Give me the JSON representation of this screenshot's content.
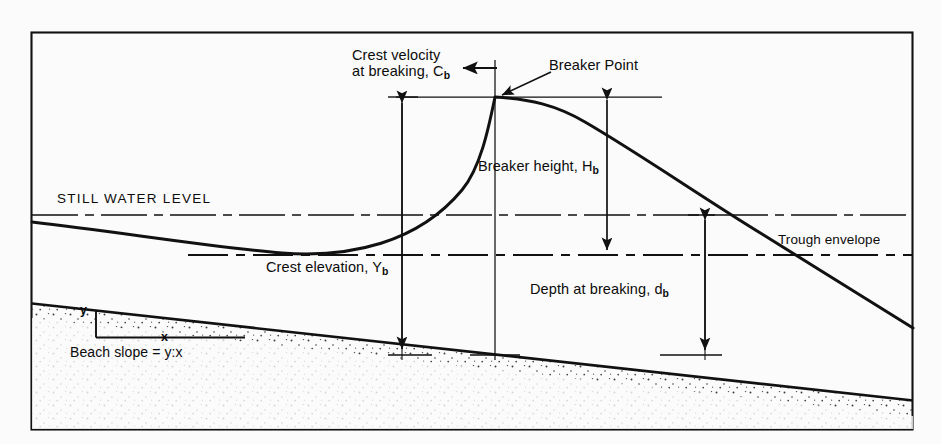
{
  "figure": {
    "type": "technical-diagram",
    "background_color": "#fbfbfb",
    "ink_color": "#111111",
    "frame": {
      "x": 31,
      "y": 32,
      "width": 882,
      "height": 398
    }
  },
  "labels": {
    "crest_velocity_line1": "Crest velocity",
    "crest_velocity_line2_text": "at breaking, C",
    "crest_velocity_sub": "b",
    "breaker_point": "Breaker Point",
    "breaker_height_text": "Breaker height, H",
    "breaker_height_sub": "b",
    "still_water_level": "STILL WATER LEVEL",
    "trough_envelope": "Trough envelope",
    "crest_elevation_text": "Crest elevation, Y",
    "crest_elevation_sub": "b",
    "depth_at_breaking_text": "Depth at breaking, d",
    "depth_at_breaking_sub": "b",
    "beach_slope": "Beach slope = y:x",
    "slope_rise": "y",
    "slope_run": "x"
  },
  "geometry": {
    "still_water_level_y": 215,
    "breaker_point": {
      "x": 495,
      "y": 97
    },
    "crest_level_y": 97,
    "trough_envelope_y": 255,
    "beach_left": {
      "x": 31,
      "y": 303
    },
    "beach_right": {
      "x": 913,
      "y": 400
    },
    "dimension_Yb_x": 402,
    "dimension_Hb_x": 607,
    "dimension_db_x": 705,
    "beach_intersect_y": 355
  }
}
